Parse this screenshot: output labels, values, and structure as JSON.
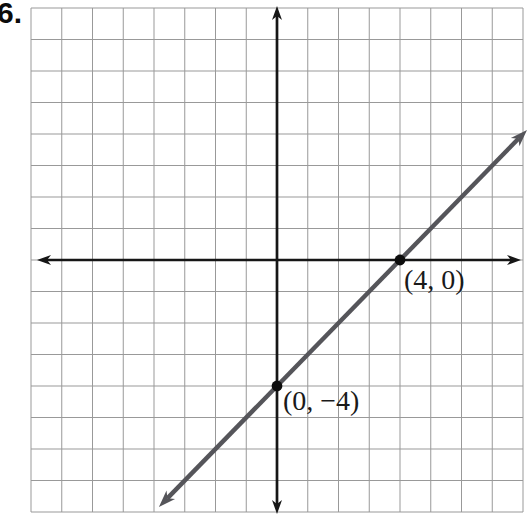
{
  "exercise_number": "6.",
  "colors": {
    "background": "#ffffff",
    "grid": "#999999",
    "axis": "#161616",
    "line": "#55555a",
    "point": "#0d0d0d",
    "label_text": "#1a1a1a"
  },
  "chart_data": {
    "type": "line",
    "title": "",
    "xlabel": "",
    "ylabel": "",
    "x_range": [
      -8,
      8
    ],
    "y_range": [
      -8,
      8
    ],
    "grid": true,
    "grid_step": 1,
    "axis_arrows": true,
    "line_arrows": true,
    "points": [
      {
        "x": 4,
        "y": 0,
        "label": "(4, 0)"
      },
      {
        "x": 0,
        "y": -4,
        "label": "(0, −4)"
      }
    ],
    "line_extent": {
      "from": [
        -3.84,
        -7.84
      ],
      "to": [
        8.13,
        4.13
      ]
    }
  }
}
